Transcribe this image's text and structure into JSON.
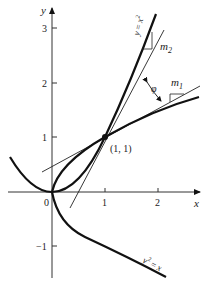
{
  "figure": {
    "type": "two-curve intersection angle diagram",
    "curves": [
      {
        "name": "parabola-up",
        "equation_label": "y = x²",
        "label_parts": {
          "lhs": "y",
          "eq": "=",
          "rhs": "x",
          "sup": "2"
        }
      },
      {
        "name": "parabola-right",
        "equation_label": "y² = x",
        "label_parts": {
          "lhs": "y",
          "sup": "2",
          "eq": "=",
          "rhs": "x"
        }
      }
    ],
    "tangents": [
      {
        "name": "tangent-m1",
        "slope_label": "m",
        "slope_sub": "1",
        "slope": 0.5
      },
      {
        "name": "tangent-m2",
        "slope_label": "m",
        "slope_sub": "2",
        "slope": 2
      }
    ],
    "angle_label": "φ",
    "intersection": {
      "label": "(1, 1)",
      "x": 1,
      "y": 1
    }
  },
  "axes": {
    "x_label": "x",
    "y_label": "y",
    "x_ticks": [
      "0",
      "1",
      "2"
    ],
    "y_ticks": [
      "3",
      "2",
      "1",
      "−1"
    ]
  },
  "colors": {
    "ink": "#111111",
    "thin": "#333333",
    "background": "#ffffff"
  }
}
